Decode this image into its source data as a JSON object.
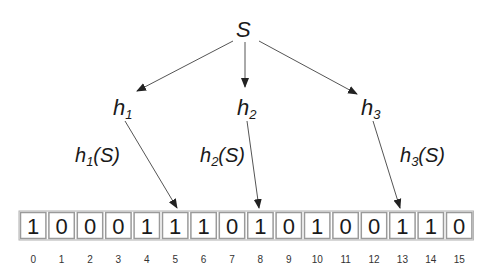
{
  "diagram": {
    "root": {
      "label": "S",
      "x": 245,
      "y": 37
    },
    "hash_nodes": [
      {
        "id": "h1",
        "base": "h",
        "sub": "1",
        "x": 113,
        "y": 117
      },
      {
        "id": "h2",
        "base": "h",
        "sub": "2",
        "x": 237,
        "y": 117
      },
      {
        "id": "h3",
        "base": "h",
        "sub": "3",
        "x": 361,
        "y": 117
      }
    ],
    "hash_outputs": [
      {
        "base": "h",
        "sub": "1",
        "arg": "(S)",
        "x": 75,
        "y": 164,
        "target_index": 5
      },
      {
        "base": "h",
        "sub": "2",
        "arg": "(S)",
        "x": 200,
        "y": 164,
        "target_index": 8
      },
      {
        "base": "h",
        "sub": "3",
        "arg": "(S)",
        "x": 400,
        "y": 164,
        "target_index": 13
      }
    ],
    "bit_array": {
      "bits": [
        "1",
        "0",
        "0",
        "0",
        "1",
        "1",
        "1",
        "0",
        "1",
        "0",
        "1",
        "0",
        "0",
        "1",
        "1",
        "0"
      ],
      "indices": [
        "0",
        "1",
        "2",
        "3",
        "4",
        "5",
        "6",
        "7",
        "8",
        "9",
        "10",
        "11",
        "12",
        "13",
        "14",
        "15"
      ],
      "x": 19,
      "y": 211,
      "cell_width": 28.4,
      "cell_height": 29
    },
    "colors": {
      "stroke": "#9a9a9a",
      "text": "#1a1a1a",
      "arrow": "#555555"
    }
  }
}
